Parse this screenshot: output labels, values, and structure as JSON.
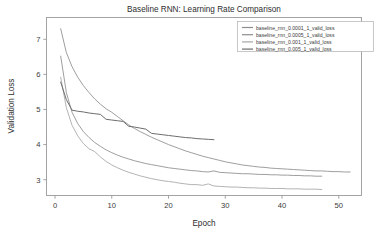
{
  "chart_data": {
    "type": "line",
    "title": "Baseline RNN: Learning Rate Comparison",
    "xlabel": "Epoch",
    "ylabel": "Validation Loss",
    "xlim": [
      -1.5,
      54
    ],
    "ylim": [
      2.55,
      7.62
    ],
    "xticks": [
      0,
      10,
      20,
      30,
      40,
      50
    ],
    "yticks": [
      3,
      4,
      5,
      6,
      7
    ],
    "xtick_labels": [
      "0",
      "10",
      "20",
      "30",
      "40",
      "50"
    ],
    "ytick_labels": [
      "3",
      "4",
      "5",
      "6",
      "7"
    ],
    "grid": false,
    "legend_position": "upper right",
    "series": [
      {
        "name": "baseline_rnn_0.0001_1_valid_loss",
        "color": "#8d8d8d",
        "linewidth": 0.85,
        "x": [
          1,
          2,
          3,
          4,
          5,
          6,
          7,
          8,
          9,
          10,
          11,
          12,
          13,
          14,
          15,
          16,
          17,
          18,
          19,
          20,
          21,
          22,
          23,
          24,
          25,
          26,
          27,
          28,
          29,
          30,
          31,
          32,
          33,
          34,
          35,
          36,
          37,
          38,
          39,
          40,
          41,
          42,
          43,
          44,
          45,
          46,
          47,
          48,
          49,
          50,
          51,
          52
        ],
        "y": [
          7.3,
          6.62,
          6.22,
          5.92,
          5.68,
          5.48,
          5.3,
          5.15,
          5.02,
          4.92,
          4.8,
          4.68,
          4.56,
          4.46,
          4.37,
          4.29,
          4.21,
          4.14,
          4.07,
          4.0,
          3.94,
          3.88,
          3.82,
          3.77,
          3.72,
          3.67,
          3.63,
          3.59,
          3.55,
          3.51,
          3.48,
          3.45,
          3.42,
          3.4,
          3.38,
          3.36,
          3.35,
          3.33,
          3.32,
          3.31,
          3.3,
          3.29,
          3.28,
          3.27,
          3.26,
          3.25,
          3.25,
          3.24,
          3.23,
          3.23,
          3.22,
          3.22
        ]
      },
      {
        "name": "baseline_rnn_0.0005_1_valid_loss",
        "color": "#8d8d8d",
        "linewidth": 0.85,
        "x": [
          1,
          2,
          3,
          4,
          5,
          6,
          7,
          8,
          9,
          10,
          11,
          12,
          13,
          14,
          15,
          16,
          17,
          18,
          19,
          20,
          21,
          22,
          23,
          24,
          25,
          26,
          27,
          28,
          29,
          30,
          31,
          32,
          33,
          34,
          35,
          36,
          37,
          38,
          39,
          40,
          41,
          42,
          43,
          44,
          45,
          46,
          47
        ],
        "y": [
          6.52,
          5.48,
          4.92,
          4.6,
          4.37,
          4.2,
          4.06,
          3.95,
          3.85,
          3.77,
          3.7,
          3.64,
          3.59,
          3.54,
          3.5,
          3.46,
          3.43,
          3.4,
          3.37,
          3.34,
          3.32,
          3.3,
          3.28,
          3.26,
          3.25,
          3.23,
          3.22,
          3.25,
          3.21,
          3.2,
          3.19,
          3.18,
          3.17,
          3.17,
          3.16,
          3.15,
          3.15,
          3.14,
          3.14,
          3.13,
          3.13,
          3.12,
          3.12,
          3.11,
          3.11,
          3.1,
          3.1
        ]
      },
      {
        "name": "baseline_rnn_0.001_1_valid_loss",
        "color": "#a5a5a5",
        "linewidth": 0.85,
        "x": [
          1,
          2,
          3,
          4,
          5,
          6,
          7,
          8,
          9,
          10,
          11,
          12,
          13,
          14,
          15,
          16,
          17,
          18,
          19,
          20,
          21,
          22,
          23,
          24,
          25,
          26,
          27,
          28,
          29,
          30,
          31,
          32,
          33,
          34,
          35,
          36,
          37,
          38,
          39,
          40,
          41,
          42,
          43,
          44,
          45,
          46,
          47
        ],
        "y": [
          5.92,
          5.05,
          4.55,
          4.25,
          4.03,
          3.88,
          3.8,
          3.65,
          3.52,
          3.42,
          3.34,
          3.27,
          3.21,
          3.16,
          3.11,
          3.07,
          3.03,
          3.0,
          2.97,
          2.95,
          2.93,
          2.9,
          2.88,
          2.86,
          2.86,
          2.84,
          2.88,
          2.82,
          2.81,
          2.8,
          2.79,
          2.79,
          2.78,
          2.77,
          2.77,
          2.76,
          2.76,
          2.75,
          2.75,
          2.75,
          2.74,
          2.74,
          2.74,
          2.73,
          2.73,
          2.73,
          2.72
        ]
      },
      {
        "name": "baseline_rnn_0.005_1_valid_loss",
        "color": "#6d6d6d",
        "linewidth": 1.0,
        "x": [
          1,
          2,
          3,
          4,
          5,
          6,
          7,
          8,
          9,
          10,
          11,
          12,
          13,
          14,
          15,
          16,
          17,
          18,
          19,
          20,
          21,
          22,
          23,
          24,
          25,
          26,
          27,
          28
        ],
        "y": [
          5.78,
          5.28,
          4.98,
          4.95,
          4.93,
          4.9,
          4.88,
          4.86,
          4.72,
          4.7,
          4.68,
          4.66,
          4.52,
          4.5,
          4.47,
          4.44,
          4.32,
          4.3,
          4.28,
          4.26,
          4.24,
          4.22,
          4.2,
          4.19,
          4.17,
          4.16,
          4.15,
          4.14
        ]
      }
    ]
  },
  "legend": {
    "entries": [
      "baseline_rnn_0.0001_1_valid_loss",
      "baseline_rnn_0.0005_1_valid_loss",
      "baseline_rnn_0.001_1_valid_loss",
      "baseline_rnn_0.005_1_valid_loss"
    ]
  },
  "colors": {
    "background": "#ffffff",
    "axis": "#9a9a9a",
    "text": "#3a3a3a",
    "series_1": "#8d8d8d",
    "series_2": "#8d8d8d",
    "series_3": "#a5a5a5",
    "series_4": "#6d6d6d"
  }
}
